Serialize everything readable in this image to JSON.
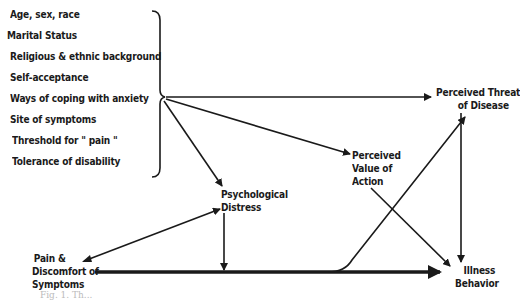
{
  "diagram": {
    "factors": [
      "Age, sex, race",
      "Marital Status",
      "Religious & ethnic background",
      "Self-acceptance",
      "Ways of coping with anxiety",
      "Site of symptoms",
      "Threshold for \" pain \"",
      "Tolerance of disability"
    ],
    "nodes": {
      "perceived_threat": [
        "Perceived Threat",
        "of Disease"
      ],
      "perceived_value": [
        "Perceived",
        "Value of",
        "Action"
      ],
      "psych_distress": [
        "Psychological",
        "Distress"
      ],
      "pain": [
        "Pain &",
        "Discomfort of",
        "Symptoms"
      ],
      "illness": [
        "Illness",
        "Behavior"
      ]
    },
    "caption": "Fig. 1. Th..."
  }
}
